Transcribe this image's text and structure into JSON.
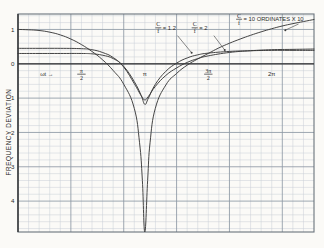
{
  "chart_data": {
    "type": "line",
    "title": "",
    "xlabel": "ωt →",
    "ylabel": "FREQUENCY DEVIATION",
    "xlim": [
      0,
      7.33
    ],
    "ylim": [
      -4.9,
      1.45
    ],
    "grid": true,
    "grid_minor_step": 0.2618,
    "grid_major_every": 5,
    "legend_position": "inline-annotations",
    "x_ticks": [
      {
        "value": 0.55,
        "label": "ωt →"
      },
      {
        "value": 1.5708,
        "label": "π/2"
      },
      {
        "value": 3.1416,
        "label": "π"
      },
      {
        "value": 4.7124,
        "label": "3π/2"
      },
      {
        "value": 6.2832,
        "label": "2π"
      }
    ],
    "y_ticks": [
      {
        "value": 1,
        "label": "1"
      },
      {
        "value": 0,
        "label": "0"
      },
      {
        "value": -1,
        "label": "1"
      },
      {
        "value": -2,
        "label": "2"
      },
      {
        "value": -3,
        "label": "3"
      },
      {
        "value": -4,
        "label": "4"
      }
    ],
    "annotations": [
      {
        "name": "curve-label-12",
        "text": "C/f = 1.2",
        "x": 3.55,
        "y": 1.03
      },
      {
        "name": "curve-label-2",
        "text": "C/f = 2",
        "x": 4.45,
        "y": 1.03
      },
      {
        "name": "ordinate-note",
        "text": "C/f = 10 ORDINATES X 10",
        "x": 5.55,
        "y": 1.28
      }
    ],
    "series": [
      {
        "name": "C/f = 1.2",
        "label": "C/f = 1.2",
        "color": "#3a3a3a",
        "points": [
          [
            0.0,
            0.3
          ],
          [
            0.52,
            0.3
          ],
          [
            1.05,
            0.3
          ],
          [
            1.57,
            0.3
          ],
          [
            1.83,
            0.29
          ],
          [
            2.09,
            0.25
          ],
          [
            2.36,
            0.15
          ],
          [
            2.62,
            -0.08
          ],
          [
            2.88,
            -0.52
          ],
          [
            3.05,
            -0.92
          ],
          [
            3.14,
            -1.18
          ],
          [
            3.23,
            -1.0
          ],
          [
            3.4,
            -0.6
          ],
          [
            3.66,
            -0.22
          ],
          [
            3.93,
            0.02
          ],
          [
            4.19,
            0.17
          ],
          [
            4.45,
            0.26
          ],
          [
            4.71,
            0.31
          ],
          [
            5.24,
            0.36
          ],
          [
            5.76,
            0.38
          ],
          [
            6.28,
            0.39
          ],
          [
            6.81,
            0.39
          ],
          [
            7.33,
            0.39
          ]
        ]
      },
      {
        "name": "C/f = 2",
        "label": "C/f = 2",
        "color": "#3a3a3a",
        "points": [
          [
            0.0,
            0.45
          ],
          [
            0.52,
            0.45
          ],
          [
            1.05,
            0.45
          ],
          [
            1.57,
            0.44
          ],
          [
            1.83,
            0.41
          ],
          [
            2.09,
            0.33
          ],
          [
            2.36,
            0.18
          ],
          [
            2.62,
            -0.1
          ],
          [
            2.88,
            -0.58
          ],
          [
            3.05,
            -0.93
          ],
          [
            3.14,
            -1.05
          ],
          [
            3.23,
            -0.95
          ],
          [
            3.4,
            -0.66
          ],
          [
            3.66,
            -0.34
          ],
          [
            3.93,
            -0.12
          ],
          [
            4.19,
            0.04
          ],
          [
            4.45,
            0.15
          ],
          [
            4.71,
            0.23
          ],
          [
            5.24,
            0.33
          ],
          [
            5.76,
            0.38
          ],
          [
            6.28,
            0.41
          ],
          [
            6.81,
            0.42
          ],
          [
            7.33,
            0.43
          ]
        ]
      },
      {
        "name": "C/f = 10 ORDINATES X 10",
        "label": "C/f = 10 ORDINATES X 10",
        "color": "#3a3a3a",
        "points": [
          [
            0.0,
            1.0
          ],
          [
            0.26,
            0.99
          ],
          [
            0.52,
            0.97
          ],
          [
            0.79,
            0.92
          ],
          [
            1.05,
            0.84
          ],
          [
            1.31,
            0.72
          ],
          [
            1.57,
            0.56
          ],
          [
            1.83,
            0.36
          ],
          [
            2.09,
            0.12
          ],
          [
            2.36,
            -0.2
          ],
          [
            2.62,
            -0.6
          ],
          [
            2.88,
            -1.3
          ],
          [
            3.01,
            -2.3
          ],
          [
            3.08,
            -3.4
          ],
          [
            3.14,
            -4.9
          ],
          [
            3.21,
            -3.4
          ],
          [
            3.27,
            -2.3
          ],
          [
            3.4,
            -1.3
          ],
          [
            3.66,
            -0.62
          ],
          [
            3.93,
            -0.28
          ],
          [
            4.19,
            -0.04
          ],
          [
            4.45,
            0.14
          ],
          [
            4.71,
            0.3
          ],
          [
            4.97,
            0.46
          ],
          [
            5.24,
            0.6
          ],
          [
            5.5,
            0.72
          ],
          [
            5.76,
            0.83
          ],
          [
            6.02,
            0.93
          ],
          [
            6.28,
            1.02
          ],
          [
            6.54,
            1.1
          ],
          [
            6.81,
            1.17
          ],
          [
            7.07,
            1.23
          ],
          [
            7.33,
            1.29
          ]
        ]
      }
    ]
  },
  "figure": {
    "axis_origin_label": "0",
    "paper_color": "#fbfaf7",
    "grid_color": "#c9cfd6",
    "grid_major_color": "#8e98a4",
    "ink_color": "#3a3a3a"
  }
}
